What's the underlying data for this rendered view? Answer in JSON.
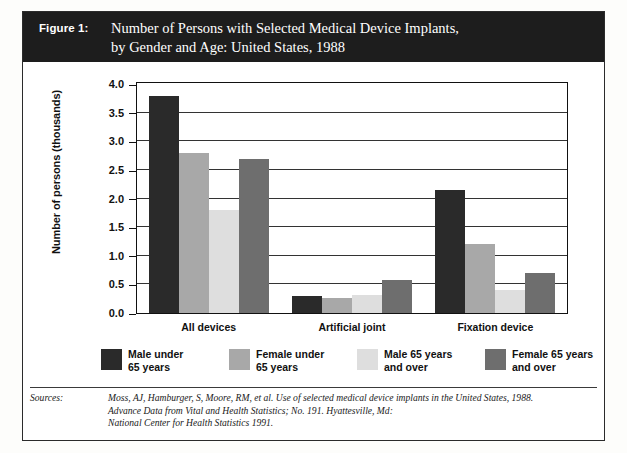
{
  "figure": {
    "label": "Figure 1:",
    "title_line1": "Number of Persons with Selected Medical Device Implants,",
    "title_line2": "by Gender and Age:  United States, 1988",
    "banner_color": "#1d1d1d"
  },
  "legend": {
    "items": [
      {
        "label": "Male under\n65 years",
        "color": "#2a2a2a",
        "swatch_name": "legend-swatch-male-under-65"
      },
      {
        "label": "Female under\n65 years",
        "color": "#a8a8a8",
        "swatch_name": "legend-swatch-female-under-65"
      },
      {
        "label": "Male 65 years\nand over",
        "color": "#dedede",
        "swatch_name": "legend-swatch-male-65-over"
      },
      {
        "label": "Female 65 years\nand over",
        "color": "#6e6e6e",
        "swatch_name": "legend-swatch-female-65-over"
      }
    ]
  },
  "source": {
    "label": "Sources:",
    "line1": "Moss, AJ, Hamburger, S, Moore, RM, et al.  Use of selected medical device implants in the United States, 1988.",
    "line2": "Advance Data from Vital and Health Statistics; No. 191.  Hyattesville, Md:",
    "line3": "National  Center for Health Statistics 1991."
  },
  "chart_data": {
    "type": "bar",
    "title": "Number of Persons with Selected Medical Device Implants, by Gender and Age:  United States, 1988",
    "xlabel": "",
    "ylabel": "Number of persons (thousands)",
    "ylim": [
      0.0,
      4.0
    ],
    "yticks": [
      "0.0",
      "0.5",
      "1.0",
      "1.5",
      "2.0",
      "2.5",
      "3.0",
      "3.5",
      "4.0"
    ],
    "grid": true,
    "legend_position": "below-plot",
    "categories": [
      "All devices",
      "Artificial joint",
      "Fixation device"
    ],
    "series": [
      {
        "name": "Male under 65 years",
        "color": "#2a2a2a",
        "values": [
          3.8,
          0.3,
          2.15
        ]
      },
      {
        "name": "Female under 65 years",
        "color": "#a8a8a8",
        "values": [
          2.8,
          0.27,
          1.2
        ]
      },
      {
        "name": "Male 65 years and over",
        "color": "#dedede",
        "values": [
          1.8,
          0.32,
          0.4
        ]
      },
      {
        "name": "Female 65 years and over",
        "color": "#6e6e6e",
        "values": [
          2.7,
          0.58,
          0.7
        ]
      }
    ]
  }
}
